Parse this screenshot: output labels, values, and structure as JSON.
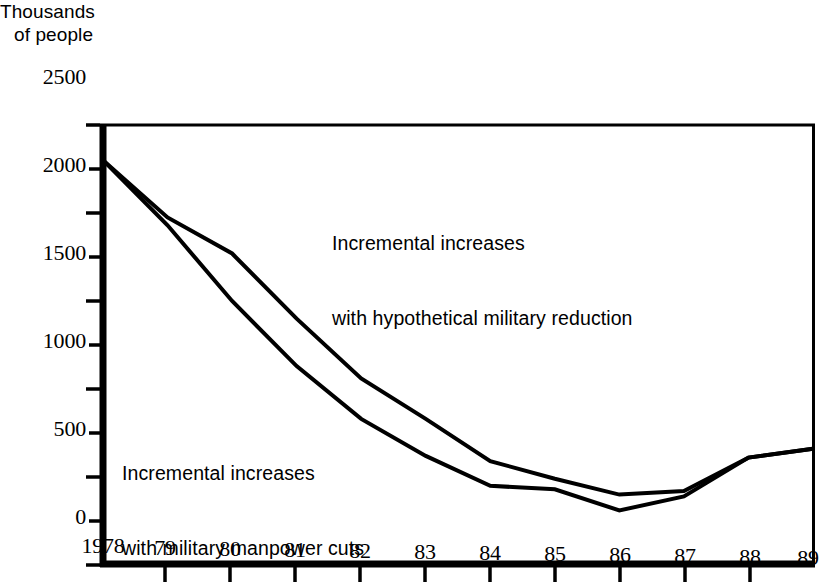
{
  "chart_data": {
    "type": "line",
    "title": "",
    "ylabel": "Thousands\nof people",
    "ylabel_line1": "Thousands",
    "ylabel_line2": "of people",
    "xlabel": "",
    "x": [
      1978,
      1979,
      1980,
      1981,
      1982,
      1983,
      1984,
      1985,
      1986,
      1987,
      1988,
      1989
    ],
    "categories": [
      "1978",
      "79",
      "80",
      "81",
      "82",
      "83",
      "84",
      "85",
      "86",
      "87",
      "88",
      "89"
    ],
    "series": [
      {
        "name": "Incremental increases with hypothetical military reduction",
        "values": [
          2300,
          1975,
          1770,
          1400,
          1060,
          830,
          590,
          490,
          400,
          420,
          610,
          660
        ]
      },
      {
        "name": "Incremental increases with military manpower cuts",
        "values": [
          2300,
          1930,
          1500,
          1130,
          830,
          620,
          450,
          430,
          310,
          390,
          610,
          660
        ]
      }
    ],
    "annotations": [
      {
        "id": "upper",
        "line1": "Incremental increases",
        "line2": "with hypothetical military reduction"
      },
      {
        "id": "lower",
        "line1": "Incremental increases",
        "line2": "with military manpower cuts"
      }
    ],
    "ylim": [
      0,
      2500
    ],
    "xlim": [
      1978,
      1989
    ],
    "ymajor_ticks": [
      0,
      500,
      1000,
      1500,
      2000,
      2500
    ],
    "ytick_labels": [
      "0",
      "500",
      "1000",
      "1500",
      "2000",
      "2500"
    ],
    "yminor_ticks": [
      250,
      750,
      1250,
      1750,
      2250
    ],
    "grid": false,
    "legend": "none",
    "line_color": "#000000"
  }
}
